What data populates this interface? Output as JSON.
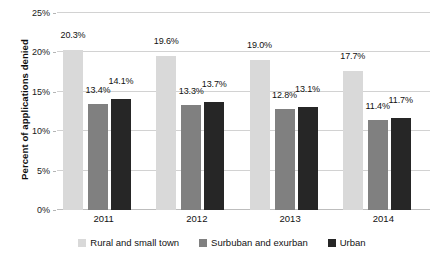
{
  "chart_data": {
    "type": "bar",
    "title": "",
    "subtitle": "",
    "xlabel": "",
    "ylabel": "Percent of applications denied",
    "categories": [
      "2011",
      "2012",
      "2013",
      "2014"
    ],
    "series": [
      {
        "name": "Rural and small town",
        "color": "#d9d9d9",
        "values": [
          20.3,
          19.6,
          19.0,
          17.7
        ],
        "labels": [
          "20.3%",
          "19.6%",
          "19.0%",
          "17.7%"
        ]
      },
      {
        "name": "Surbuban and exurban",
        "color": "#808080",
        "values": [
          13.4,
          13.3,
          12.8,
          11.4
        ],
        "labels": [
          "13.4%",
          "13.3%",
          "12.8%",
          "11.4%"
        ]
      },
      {
        "name": "Urban",
        "color": "#262626",
        "values": [
          14.1,
          13.7,
          13.1,
          11.7
        ],
        "labels": [
          "14.1%",
          "13.7%",
          "13.1%",
          "11.7%"
        ]
      }
    ],
    "ylim": [
      0,
      25
    ],
    "ytick_values": [
      0,
      5,
      10,
      15,
      20,
      25
    ],
    "ytick_labels": [
      "0%",
      "5%",
      "10%",
      "15%",
      "20%",
      "25%"
    ],
    "grid": true,
    "grid_axis": "y",
    "legend_position": "bottom",
    "legend": [
      "Rural and small town",
      "Surbuban and exurban",
      "Urban"
    ],
    "background_color": "#ffffff",
    "gridline_color": "#d2d2d2"
  }
}
